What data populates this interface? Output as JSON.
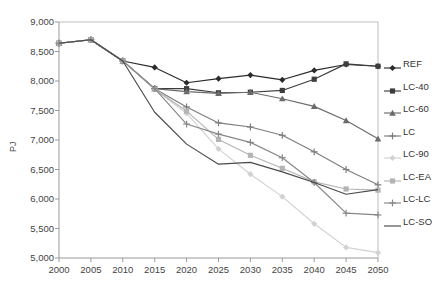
{
  "chart_data": {
    "type": "line",
    "title": "",
    "xlabel": "",
    "ylabel": "PJ",
    "x": [
      2000,
      2005,
      2010,
      2015,
      2020,
      2025,
      2030,
      2035,
      2040,
      2045,
      2050
    ],
    "xlim": [
      2000,
      2050
    ],
    "ylim": [
      5000,
      9000
    ],
    "ytick_labels": [
      "9,000",
      "8,500",
      "8,000",
      "7,500",
      "7,000",
      "6,500",
      "6,000",
      "5,500",
      "5,000"
    ],
    "ytick_values": [
      9000,
      8500,
      8000,
      7500,
      7000,
      6500,
      6000,
      5500,
      5000
    ],
    "xtick_labels": [
      "2000",
      "2005",
      "2010",
      "2015",
      "2020",
      "2025",
      "2030",
      "2035",
      "2040",
      "2045",
      "2050"
    ],
    "grid": false,
    "legend_position": "right",
    "series": [
      {
        "name": "REF",
        "color": "#2b2b2b",
        "marker": "diamond",
        "values": [
          8640,
          8700,
          8340,
          8230,
          7970,
          8040,
          8100,
          8020,
          8180,
          8280,
          8250
        ]
      },
      {
        "name": "LC-40",
        "color": "#3d3d3d",
        "marker": "square",
        "values": [
          8640,
          8700,
          8340,
          7870,
          7870,
          7800,
          7810,
          7840,
          8030,
          8290,
          8250
        ]
      },
      {
        "name": "LC-60",
        "color": "#6b6b6b",
        "marker": "triangle",
        "values": [
          8640,
          8700,
          8340,
          7870,
          7820,
          7790,
          7810,
          7700,
          7570,
          7330,
          7020
        ]
      },
      {
        "name": "LC",
        "color": "#7d7d7d",
        "marker": "plus",
        "values": [
          8640,
          8700,
          8340,
          7870,
          7560,
          7290,
          7220,
          7080,
          6800,
          6500,
          6240
        ]
      },
      {
        "name": "LC-90",
        "color": "#d2d2d2",
        "marker": "diamond",
        "values": [
          8640,
          8700,
          8340,
          7860,
          7450,
          6850,
          6420,
          6040,
          5580,
          5180,
          5090
        ]
      },
      {
        "name": "LC-EA",
        "color": "#b4b4b4",
        "marker": "square",
        "values": [
          8640,
          8700,
          8340,
          7860,
          7490,
          7010,
          6740,
          6520,
          6290,
          6170,
          6150
        ]
      },
      {
        "name": "LC-LC",
        "color": "#878787",
        "marker": "plus",
        "values": [
          8640,
          8700,
          8340,
          7870,
          7270,
          7100,
          6960,
          6700,
          6280,
          5760,
          5730
        ]
      },
      {
        "name": "LC-SO",
        "color": "#4a4a4a",
        "marker": "none",
        "values": [
          8640,
          8700,
          8340,
          7470,
          6930,
          6590,
          6620,
          6460,
          6280,
          6080,
          6160
        ]
      }
    ]
  },
  "axis": {
    "y_title": "PJ"
  }
}
